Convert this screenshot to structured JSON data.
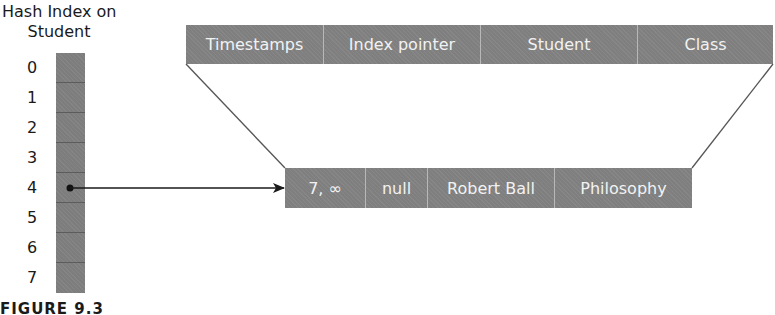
{
  "hash_index": {
    "title_line1": "Hash Index on",
    "title_line2": "Student",
    "buckets": [
      "0",
      "1",
      "2",
      "3",
      "4",
      "5",
      "6",
      "7"
    ],
    "pointer_bucket": "4"
  },
  "header_row": {
    "columns": [
      "Timestamps",
      "Index pointer",
      "Student",
      "Class"
    ]
  },
  "record_row": {
    "cells": [
      "7, ∞",
      "null",
      "Robert Ball",
      "Philosophy"
    ]
  },
  "caption": "FIGURE 9.3",
  "colors": {
    "cell_fill": "#7f7f7f",
    "cell_text": "#f2f2f2",
    "line": "#1a1a1a"
  }
}
